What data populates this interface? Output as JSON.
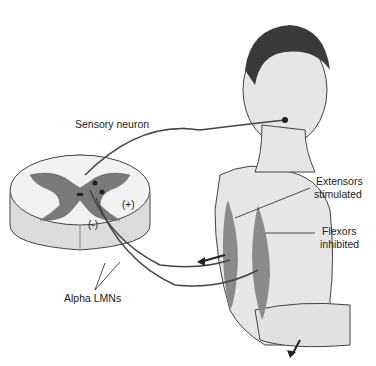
{
  "diagram": {
    "labels": {
      "sensory_neuron": "Sensory neuron",
      "extensors_line1": "Extensors",
      "extensors_line2": "stimulated",
      "flexors_line1": "Flexors",
      "flexors_line2": "inhibited",
      "alpha_lmns": "Alpha LMNs",
      "plus_sign": "(+)",
      "minus_sign": "(-)"
    },
    "colors": {
      "gray_matter": "#7a7a7a",
      "white_matter": "#eeeeee",
      "skin": "#e6e6e6",
      "muscle": "#8a8a8a",
      "hair": "#3a3a3a",
      "nerve": "#444444"
    }
  }
}
